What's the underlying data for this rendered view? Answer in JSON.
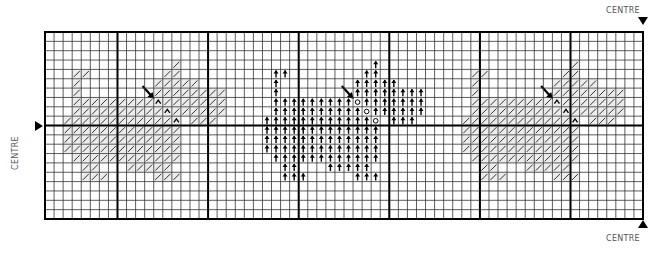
{
  "labels": {
    "centre_top": "CENTRE",
    "centre_bottom": "CENTRE",
    "centre_left": "CENTRE"
  },
  "grid": {
    "cols": 66,
    "rows": 20,
    "origin_x": 45,
    "origin_y": 32,
    "width": 598,
    "height": 187,
    "thick_cols": [
      0,
      8,
      18,
      28,
      38,
      48,
      58,
      66
    ],
    "thick_rows": [
      0,
      10,
      20
    ],
    "line_color": "#000000",
    "thin_line_color": "#333333"
  },
  "symbols": {
    "solid": "arrow-up-symbol",
    "light": "slash-symbol",
    "solid_accent": "circle-symbol",
    "light_accent": "caret-symbol",
    "pointer": "backstitch-arrow-marker"
  },
  "motif": {
    "description": "bird",
    "cells": [
      [
        3,
        36
      ],
      [
        4,
        25
      ],
      [
        4,
        26
      ],
      [
        4,
        35
      ],
      [
        4,
        36
      ],
      [
        5,
        25
      ],
      [
        5,
        34
      ],
      [
        5,
        35
      ],
      [
        5,
        36
      ],
      [
        5,
        37
      ],
      [
        5,
        38
      ],
      [
        6,
        25
      ],
      [
        6,
        34
      ],
      [
        6,
        35
      ],
      [
        6,
        36
      ],
      [
        6,
        37
      ],
      [
        6,
        38
      ],
      [
        6,
        39
      ],
      [
        6,
        40
      ],
      [
        6,
        41
      ],
      [
        7,
        25
      ],
      [
        7,
        26
      ],
      [
        7,
        27
      ],
      [
        7,
        28
      ],
      [
        7,
        29
      ],
      [
        7,
        30
      ],
      [
        7,
        31
      ],
      [
        7,
        32
      ],
      [
        7,
        33
      ],
      [
        7,
        35
      ],
      [
        7,
        36
      ],
      [
        7,
        37
      ],
      [
        7,
        38
      ],
      [
        7,
        39
      ],
      [
        7,
        40
      ],
      [
        7,
        41
      ],
      [
        8,
        25
      ],
      [
        8,
        26
      ],
      [
        8,
        27
      ],
      [
        8,
        28
      ],
      [
        8,
        29
      ],
      [
        8,
        30
      ],
      [
        8,
        31
      ],
      [
        8,
        32
      ],
      [
        8,
        33
      ],
      [
        8,
        34
      ],
      [
        8,
        36
      ],
      [
        8,
        37
      ],
      [
        8,
        38
      ],
      [
        8,
        39
      ],
      [
        8,
        40
      ],
      [
        8,
        41
      ],
      [
        9,
        24
      ],
      [
        9,
        25
      ],
      [
        9,
        26
      ],
      [
        9,
        27
      ],
      [
        9,
        28
      ],
      [
        9,
        29
      ],
      [
        9,
        30
      ],
      [
        9,
        31
      ],
      [
        9,
        32
      ],
      [
        9,
        33
      ],
      [
        9,
        34
      ],
      [
        9,
        35
      ],
      [
        9,
        38
      ],
      [
        9,
        39
      ],
      [
        9,
        40
      ],
      [
        10,
        24
      ],
      [
        10,
        25
      ],
      [
        10,
        26
      ],
      [
        10,
        27
      ],
      [
        10,
        28
      ],
      [
        10,
        29
      ],
      [
        10,
        30
      ],
      [
        10,
        31
      ],
      [
        10,
        32
      ],
      [
        10,
        33
      ],
      [
        10,
        34
      ],
      [
        10,
        35
      ],
      [
        10,
        36
      ],
      [
        11,
        24
      ],
      [
        11,
        25
      ],
      [
        11,
        26
      ],
      [
        11,
        27
      ],
      [
        11,
        28
      ],
      [
        11,
        29
      ],
      [
        11,
        30
      ],
      [
        11,
        31
      ],
      [
        11,
        32
      ],
      [
        11,
        33
      ],
      [
        11,
        34
      ],
      [
        11,
        35
      ],
      [
        11,
        36
      ],
      [
        12,
        24
      ],
      [
        12,
        25
      ],
      [
        12,
        26
      ],
      [
        12,
        27
      ],
      [
        12,
        28
      ],
      [
        12,
        29
      ],
      [
        12,
        30
      ],
      [
        12,
        31
      ],
      [
        12,
        32
      ],
      [
        12,
        33
      ],
      [
        12,
        34
      ],
      [
        12,
        35
      ],
      [
        12,
        36
      ],
      [
        13,
        25
      ],
      [
        13,
        26
      ],
      [
        13,
        27
      ],
      [
        13,
        28
      ],
      [
        13,
        29
      ],
      [
        13,
        30
      ],
      [
        13,
        31
      ],
      [
        13,
        32
      ],
      [
        13,
        33
      ],
      [
        13,
        34
      ],
      [
        13,
        35
      ],
      [
        13,
        36
      ],
      [
        14,
        26
      ],
      [
        14,
        27
      ],
      [
        14,
        31
      ],
      [
        14,
        32
      ],
      [
        14,
        33
      ],
      [
        14,
        34
      ],
      [
        14,
        35
      ],
      [
        15,
        26
      ],
      [
        15,
        27
      ],
      [
        15,
        28
      ],
      [
        15,
        34
      ],
      [
        15,
        35
      ],
      [
        15,
        36
      ]
    ],
    "accent_cells": [
      [
        7,
        34
      ],
      [
        8,
        35
      ],
      [
        9,
        36
      ]
    ],
    "pointer_cell": [
      6,
      33
    ]
  },
  "instances": [
    {
      "name": "left-motif",
      "col_offset": -22,
      "style": "light"
    },
    {
      "name": "center-motif",
      "col_offset": 0,
      "style": "solid"
    },
    {
      "name": "right-motif",
      "col_offset": 22,
      "style": "light"
    }
  ]
}
